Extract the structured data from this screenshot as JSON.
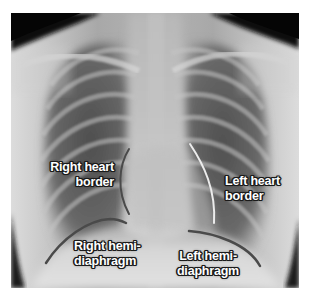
{
  "figure": {
    "type": "chest-xray-pa",
    "colors": {
      "background": "#ffffff",
      "right_heart_border_line": "#4a4a4a",
      "left_heart_border_line": "#ececec",
      "right_hemidiaphragm_line": "#4a4a4a",
      "left_hemidiaphragm_line": "#4a4a4a",
      "label_text": "#ffffff",
      "label_outline": "#1a1a1a"
    }
  },
  "labels": {
    "right_heart_border": {
      "line1": "Right heart",
      "line2": "border"
    },
    "left_heart_border": {
      "line1": "Left heart",
      "line2": "border"
    },
    "right_hemidiaphragm": {
      "line1": "Right hemi-",
      "line2": "diaphragm"
    },
    "left_hemidiaphragm": {
      "line1": "Left hemi-",
      "line2": "diaphragm"
    }
  }
}
